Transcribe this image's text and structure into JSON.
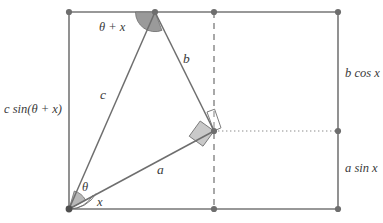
{
  "figure": {
    "colors": {
      "line": "#767676",
      "construction": "#8c8c8c",
      "sector_fill": "#9a9a9a",
      "square_fill": "#c9c9c9",
      "node": "#6e6e6e",
      "text": "#3a3a3a",
      "background": "#ffffff"
    },
    "sides": {
      "hypotenuse_left": "c",
      "upper_right": "b",
      "lower": "a"
    },
    "angles": {
      "apex": "θ + x",
      "lower_inner": "θ",
      "lower_outer": "x"
    },
    "edges": {
      "left": "c sin(θ + x)",
      "right_upper": "b cos x",
      "right_lower": "a sin x"
    },
    "geometry": {
      "rect": {
        "x1": 69,
        "y1": 12,
        "x2": 338,
        "y2": 209
      },
      "apex": {
        "x": 155,
        "y": 12
      },
      "origin": {
        "x": 69,
        "y": 209
      },
      "corner": {
        "x": 214,
        "y": 131
      },
      "divider_x": 214,
      "divider_top_y": 12,
      "divider_bottom_y": 209,
      "dotted_right_x": 338,
      "dotted_y": 131
    }
  }
}
